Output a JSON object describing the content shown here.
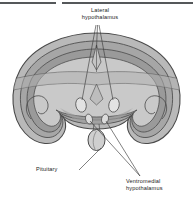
{
  "figure": {
    "background_color": "#ffffff",
    "rules": {
      "color": "#55585a",
      "left_label": "top-rule-left",
      "right_label": "top-rule-right"
    },
    "palette": {
      "outline": "#4a4a4a",
      "cortex_outer": "#b9b9b9",
      "cortex_mid": "#a6a6a6",
      "cortex_inner": "#9a9a9a",
      "core_light": "#c9c9c9",
      "core_mid": "#b0b0b0",
      "nucleus_fill": "#dedede",
      "pituitary_fill": "#cfcfcf",
      "leader_line": "#3c3c3c",
      "text": "#232323"
    },
    "labels": [
      {
        "id": "lateral",
        "text": "Lateral\nhypothalamus",
        "position": "top-center"
      },
      {
        "id": "pituitary",
        "text": "Pituitary",
        "position": "bottom-left"
      },
      {
        "id": "ventromedial",
        "text": "Ventromedial\nhypothalamus",
        "position": "bottom-right"
      }
    ],
    "structures": [
      {
        "name": "cerebral-hemispheres",
        "count": 2
      },
      {
        "name": "lateral-hypothalamic-nucleus",
        "count": 2
      },
      {
        "name": "ventromedial-hypothalamic-nucleus",
        "count": 2
      },
      {
        "name": "third-ventricle-midline",
        "count": 1
      },
      {
        "name": "pituitary-gland",
        "count": 1
      },
      {
        "name": "temporal-lobe-curl",
        "count": 2
      }
    ]
  }
}
